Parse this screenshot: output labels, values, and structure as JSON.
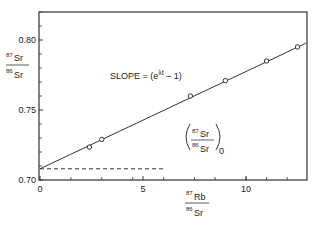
{
  "chart_data": {
    "type": "scatter",
    "title": "",
    "xlabel": {
      "numerator": "87",
      "numerator_el": "Rb",
      "denominator": "86",
      "denominator_el": "Sr"
    },
    "ylabel": {
      "numerator": "87",
      "numerator_el": "Sr",
      "denominator": "86",
      "denominator_el": "Sr"
    },
    "xlim": [
      0,
      13
    ],
    "ylim": [
      0.7,
      0.828
    ],
    "x_ticks_major": [
      0,
      5,
      10
    ],
    "x_tick_labels": [
      "0",
      "5",
      "10"
    ],
    "x_ticks_minor": [
      1.5,
      3,
      4.5,
      6,
      7.5,
      8.5,
      10,
      11,
      12
    ],
    "y_ticks_major": [
      0.7,
      0.75,
      0.8
    ],
    "y_tick_labels": [
      "0.70",
      "0.75",
      "0.80"
    ],
    "y_ticks_minor": [
      0.71,
      0.72,
      0.73,
      0.74,
      0.76,
      0.77,
      0.78,
      0.79,
      0.81,
      0.82
    ],
    "grid": false,
    "series": [
      {
        "name": "samples",
        "marker": "open-circle",
        "x": [
          2.4,
          3.0,
          7.3,
          9.0,
          11.0,
          12.5
        ],
        "y": [
          0.7235,
          0.729,
          0.76,
          0.771,
          0.785,
          0.795
        ]
      }
    ],
    "fit_line": {
      "intercept": 0.708,
      "slope": 0.00695,
      "x_range": [
        0,
        12.9
      ]
    },
    "initial_ratio_line": {
      "y": 0.708,
      "x_range": [
        0,
        6.1
      ],
      "style": "dashed"
    },
    "annotations": {
      "slope": {
        "prefix": "SLOPE = (e",
        "superscript": "λt",
        "suffix": " – 1)"
      },
      "initial_ratio": {
        "numerator": "87",
        "numerator_el": "Sr",
        "denominator": "86",
        "denominator_el": "Sr",
        "subscript": "0"
      }
    }
  }
}
